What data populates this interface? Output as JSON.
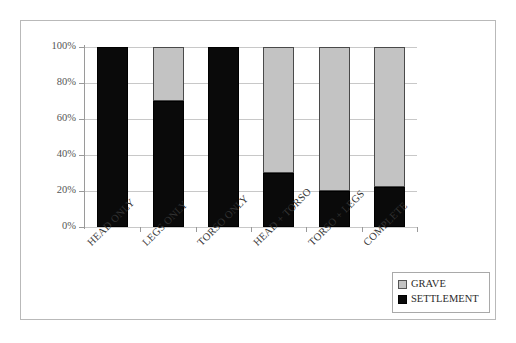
{
  "chart_data": {
    "type": "bar",
    "subtype": "100% stacked bar",
    "title": "",
    "subtitle": "",
    "xlabel": "",
    "ylabel": "",
    "ylim": [
      0,
      100
    ],
    "yticks": [
      "0%",
      "20%",
      "40%",
      "60%",
      "80%",
      "100%"
    ],
    "ytick_values": [
      0,
      20,
      40,
      60,
      80,
      100
    ],
    "grid": true,
    "legend_position": "bottom-right",
    "categories": [
      "HEAD ONLY",
      "LEGS ONLY",
      "TORSO ONLY",
      "HEAD + TORSO",
      "TORSO + LEGS",
      "COMPLETE"
    ],
    "series": [
      {
        "name": "GRAVE",
        "color": "#c3c3c3",
        "values": [
          0,
          30,
          0,
          70,
          80,
          78
        ]
      },
      {
        "name": "SETTLEMENT",
        "color": "#0a0a0a",
        "values": [
          100,
          70,
          100,
          30,
          20,
          22
        ]
      }
    ],
    "legend": [
      {
        "label": "GRAVE",
        "color": "#c3c3c3"
      },
      {
        "label": "SETTLEMENT",
        "color": "#0a0a0a"
      }
    ]
  }
}
